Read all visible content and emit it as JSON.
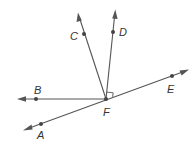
{
  "diagram": {
    "type": "geometry-angles",
    "vertex": {
      "label": "F",
      "x": 106,
      "y": 99,
      "label_x": 103,
      "label_y": 119
    },
    "right_angle_marker": {
      "between": [
        "FE",
        "FD"
      ]
    },
    "rays": [
      {
        "name": "ray-FB",
        "point_label": "B",
        "point": [
          36,
          99
        ],
        "tip": [
          18,
          99
        ],
        "label_pos": [
          34,
          94
        ]
      },
      {
        "name": "ray-FC",
        "point_label": "C",
        "point": [
          84,
          34
        ],
        "tip": [
          78,
          13
        ],
        "label_pos": [
          71,
          41
        ]
      },
      {
        "name": "ray-FD",
        "point_label": "D",
        "point": [
          113,
          32
        ],
        "tip": [
          115,
          10
        ],
        "label_pos": [
          119,
          36
        ]
      }
    ],
    "line_AE": {
      "points": [
        {
          "label": "A",
          "point": [
            41,
            124
          ],
          "tip": [
            24,
            130
          ],
          "label_pos": [
            37,
            139
          ]
        },
        {
          "label": "E",
          "point": [
            172,
            76
          ],
          "tip": [
            188,
            70
          ],
          "label_pos": [
            168,
            93
          ]
        }
      ]
    },
    "labels": {
      "A": "A",
      "B": "B",
      "C": "C",
      "D": "D",
      "E": "E",
      "F": "F"
    },
    "colors": {
      "line": "#555555",
      "point": "#444444",
      "text": "#333333"
    }
  }
}
